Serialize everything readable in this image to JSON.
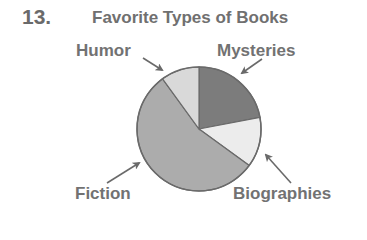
{
  "problem_number": "13.",
  "chart_data": {
    "type": "pie",
    "title": "Favorite Types of Books",
    "categories": [
      "Mysteries",
      "Biographies",
      "Fiction",
      "Humor"
    ],
    "values": [
      22,
      13,
      55,
      10
    ],
    "unit": "percent (estimated from slice angles; no values shown)",
    "colors": [
      "#7c7c7c",
      "#ececec",
      "#acacac",
      "#d9d9d9"
    ],
    "start_angle_deg_clockwise_from_top": 0,
    "legend": "none (direct labels with arrows)"
  },
  "labels": {
    "humor": "Humor",
    "mysteries": "Mysteries",
    "fiction": "Fiction",
    "biographies": "Biographies"
  },
  "style": {
    "text_color": "#707070",
    "outline_color": "#6a6a6a",
    "arrow_color": "#6a6a6a"
  }
}
